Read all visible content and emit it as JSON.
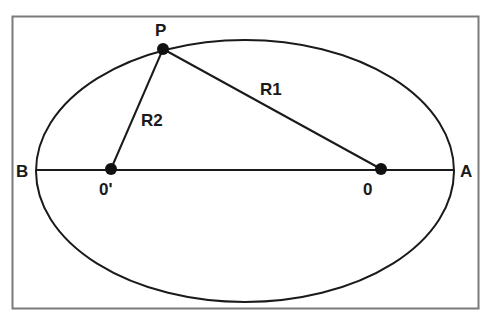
{
  "diagram": {
    "colors": {
      "stroke": "#1a1a1a",
      "frame": "#7a7a7a",
      "background": "#ffffff"
    },
    "frame": {
      "x": 12,
      "y": 16,
      "width": 467,
      "height": 293
    },
    "ellipse": {
      "cx": 245,
      "cy": 171,
      "rx": 209,
      "ry": 131
    },
    "major_axis": {
      "x1": 36,
      "y1": 170,
      "x2": 454,
      "y2": 170
    },
    "points": {
      "P": {
        "label": "P",
        "x": 163,
        "y": 49
      },
      "O": {
        "label": "0",
        "x": 381,
        "y": 169
      },
      "O_prime": {
        "label": "0'",
        "x": 111,
        "y": 169
      }
    },
    "segments": {
      "R1": {
        "label": "R1"
      },
      "R2": {
        "label": "R2"
      }
    },
    "vertex_labels": {
      "A": "A",
      "B": "B"
    }
  }
}
